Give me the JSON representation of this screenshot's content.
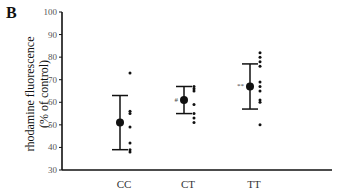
{
  "panel_label": "B",
  "chart_data": {
    "type": "scatter",
    "title": "",
    "xlabel": "",
    "ylabel": "rhodamine fluorescence (% of control)",
    "ylabel_lines": [
      "rhodamine fluorescence",
      "(% of control)"
    ],
    "ylim": [
      30,
      100
    ],
    "yticks": [
      30,
      40,
      50,
      60,
      70,
      80,
      90,
      100
    ],
    "grid": false,
    "legend": null,
    "categories": [
      "CC",
      "CT",
      "TT"
    ],
    "groups": [
      {
        "name": "CC",
        "mean": 51,
        "upper": 63,
        "lower": 39,
        "annotation": "",
        "points": [
          73,
          56,
          55,
          49,
          42,
          39,
          38
        ]
      },
      {
        "name": "CT",
        "mean": 61,
        "upper": 67,
        "lower": 55,
        "annotation": "#",
        "points": [
          67,
          66,
          65,
          59,
          55,
          53,
          51
        ]
      },
      {
        "name": "TT",
        "mean": 67,
        "upper": 77,
        "lower": 57,
        "annotation": "**",
        "points": [
          82,
          80,
          78,
          76,
          69,
          67,
          65,
          61,
          60,
          50
        ]
      }
    ]
  }
}
